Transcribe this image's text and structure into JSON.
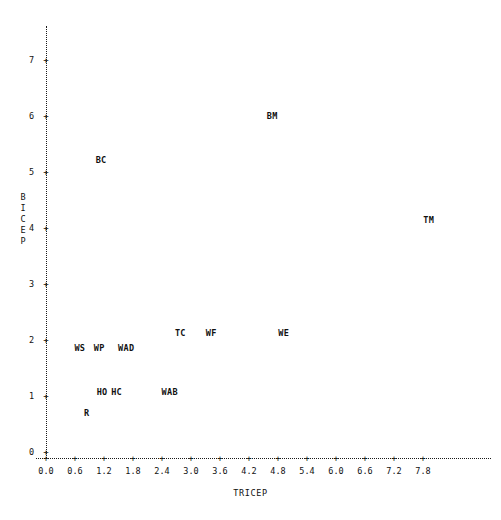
{
  "chart_data": {
    "type": "scatter",
    "title": "",
    "xlabel": "TRICEP",
    "ylabel": "BICEP",
    "ylabel_stacked": [
      "B",
      "I",
      "C",
      "E",
      "P"
    ],
    "xlim": [
      0.0,
      8.1
    ],
    "ylim": [
      0,
      7.4
    ],
    "grid": false,
    "legend": "none",
    "marker_style": "text-label",
    "xticks": [
      "0.0",
      "0.6",
      "1.2",
      "1.8",
      "2.4",
      "3.0",
      "3.6",
      "4.2",
      "4.8",
      "5.4",
      "6.0",
      "6.6",
      "7.2",
      "7.8"
    ],
    "xtick_values": [
      0.0,
      0.6,
      1.2,
      1.8,
      2.4,
      3.0,
      3.6,
      4.2,
      4.8,
      5.4,
      6.0,
      6.6,
      7.2,
      7.8
    ],
    "yticks": [
      "0",
      "1",
      "2",
      "3",
      "4",
      "5",
      "6",
      "7"
    ],
    "ytick_values": [
      0,
      1,
      2,
      3,
      4,
      5,
      6,
      7
    ],
    "tick_glyph": "+",
    "axis_color": "#111111",
    "background_color": "#ffffff",
    "points": [
      {
        "label": "BM",
        "x": 4.68,
        "y": 6.0
      },
      {
        "label": "BC",
        "x": 1.14,
        "y": 5.22
      },
      {
        "label": "TM",
        "x": 7.92,
        "y": 4.14
      },
      {
        "label": "TC",
        "x": 2.78,
        "y": 2.12
      },
      {
        "label": "WF",
        "x": 3.42,
        "y": 2.12
      },
      {
        "label": "WE",
        "x": 4.92,
        "y": 2.12
      },
      {
        "label": "WS",
        "x": 0.7,
        "y": 1.86
      },
      {
        "label": "WP",
        "x": 1.1,
        "y": 1.86
      },
      {
        "label": "WAD",
        "x": 1.66,
        "y": 1.86
      },
      {
        "label": "HO",
        "x": 1.16,
        "y": 1.07
      },
      {
        "label": "HC",
        "x": 1.46,
        "y": 1.07
      },
      {
        "label": "WAB",
        "x": 2.56,
        "y": 1.07
      },
      {
        "label": "R",
        "x": 0.84,
        "y": 0.7
      }
    ]
  },
  "axes": {
    "origin_px": {
      "x": 46,
      "y": 452
    },
    "x_unit_px": 48.33,
    "y_unit_px": 56.0
  }
}
